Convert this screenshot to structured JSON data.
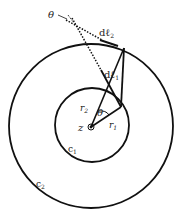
{
  "diagram": {
    "type": "concentric-contours",
    "center_label": "z",
    "inner_contour_label": "c",
    "inner_contour_sub": "1",
    "outer_contour_label": "c",
    "outer_contour_sub": "2",
    "radius_inner_label": "r",
    "radius_inner_sub": "1",
    "radius_outer_label": "r",
    "radius_outer_sub": "2",
    "angle_label_center": "θ",
    "angle_label_outer": "θ",
    "element_outer_label": "dℓ",
    "element_outer_sub": "2",
    "element_inner_label": "dℓ",
    "element_inner_sub": "1",
    "stroke_color": "#111111"
  }
}
